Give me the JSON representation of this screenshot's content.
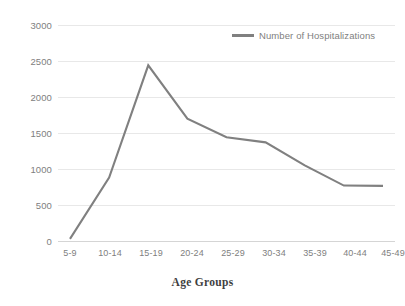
{
  "chart_data": {
    "type": "line",
    "title": "",
    "xlabel": "Age Groups",
    "ylabel": "",
    "categories": [
      "5-9",
      "10-14",
      "15-19",
      "20-24",
      "25-29",
      "30-34",
      "35-39",
      "40-44",
      "45-49"
    ],
    "series": [
      {
        "name": "Number of Hospitalizations",
        "color": "#808080",
        "values": [
          30,
          880,
          2440,
          1700,
          1440,
          1370,
          1050,
          770,
          765
        ]
      }
    ],
    "ylim": [
      0,
      3000
    ],
    "yticks": [
      0,
      500,
      1000,
      1500,
      2000,
      2500,
      3000
    ],
    "ytick_labels": [
      "0",
      "500",
      "1000",
      "1500",
      "2000",
      "2500",
      "3000"
    ],
    "grid": true,
    "legend_position": "top-right"
  },
  "axes": {
    "x_title": "Age Groups",
    "y_ticks": [
      "3000",
      "2500",
      "2000",
      "1500",
      "1000",
      "500",
      "0"
    ],
    "x_ticks": [
      "5-9",
      "10-14",
      "15-19",
      "20-24",
      "25-29",
      "30-34",
      "35-39",
      "40-44",
      "45-49"
    ]
  },
  "legend": {
    "entries": [
      {
        "label": "Number of Hospitalizations",
        "color": "#808080"
      }
    ]
  },
  "colors": {
    "series_line": "#808080",
    "gridline": "#e8e8e8",
    "tick_text": "#808080",
    "axis_title": "#3f3f3f",
    "background": "#ffffff"
  }
}
